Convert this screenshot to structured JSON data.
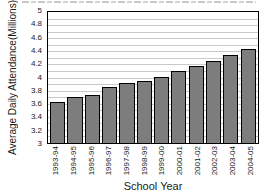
{
  "figure": {
    "ylabel_line1": "Average Daily Attendance",
    "ylabel_line2": "(Millions)",
    "xlabel": "School Year"
  },
  "chart_data": {
    "type": "bar",
    "categories": [
      "1993-94",
      "1994-95",
      "1995-96",
      "1996-97",
      "1997-98",
      "1998-99",
      "1999-00",
      "2000-01",
      "2001-02",
      "2002-03",
      "2003-04",
      "2004-05"
    ],
    "values": [
      3.62,
      3.7,
      3.74,
      3.85,
      3.91,
      3.94,
      4.01,
      4.1,
      4.17,
      4.25,
      4.34,
      4.43
    ],
    "xlabel": "School Year",
    "ylabel": "Average Daily Attendance (Millions)",
    "ylim": [
      3,
      5
    ],
    "ytick_step": 0.2,
    "ytick_labels_top_to_bottom": [
      "5",
      "4.8",
      "4.6",
      "4.4",
      "4.2",
      "4",
      "3.8",
      "3.6",
      "3.4",
      "3.2",
      "3"
    ],
    "gridline_step": 0.1,
    "grid": true,
    "legend": false,
    "colors": {
      "bar_fill": "#7d7d7d",
      "bar_border": "#000000",
      "gridline": "#c9c9c9",
      "axis": "#000000",
      "background": "#ffffff"
    }
  }
}
